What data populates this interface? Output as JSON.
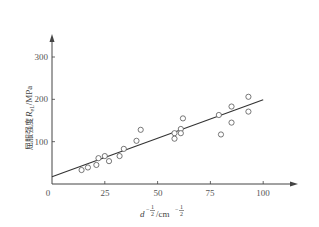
{
  "chart_data": {
    "type": "scatter",
    "title": "",
    "xlabel": "d^(-1/2)/cm^(-1/2)",
    "ylabel": "屈服强度 R_eL/MPa",
    "xlabel_parts": {
      "base": "d",
      "exp": "-1/2",
      "unit": "/cm",
      "unit_exp": "-1/2"
    },
    "ylabel_parts": {
      "text": "屈服强度",
      "symbol": "R",
      "sub": "eL",
      "unit": "/MPa"
    },
    "xlim": [
      0,
      100
    ],
    "ylim": [
      0,
      300
    ],
    "xticks": [
      0,
      25,
      50,
      75,
      100
    ],
    "yticks": [
      100,
      200,
      300
    ],
    "grid": false,
    "legend": null,
    "points": [
      {
        "x": 14,
        "y": 33
      },
      {
        "x": 17,
        "y": 39
      },
      {
        "x": 21,
        "y": 45
      },
      {
        "x": 22,
        "y": 61
      },
      {
        "x": 25,
        "y": 66
      },
      {
        "x": 27,
        "y": 54
      },
      {
        "x": 32,
        "y": 66
      },
      {
        "x": 34,
        "y": 83
      },
      {
        "x": 40,
        "y": 102
      },
      {
        "x": 42,
        "y": 128
      },
      {
        "x": 58,
        "y": 120
      },
      {
        "x": 58,
        "y": 107
      },
      {
        "x": 61,
        "y": 130
      },
      {
        "x": 61,
        "y": 120
      },
      {
        "x": 62,
        "y": 155
      },
      {
        "x": 79,
        "y": 163
      },
      {
        "x": 80,
        "y": 117
      },
      {
        "x": 85,
        "y": 183
      },
      {
        "x": 85,
        "y": 145
      },
      {
        "x": 93,
        "y": 206
      },
      {
        "x": 93,
        "y": 171
      }
    ],
    "fit_line": {
      "x": [
        0,
        100
      ],
      "y": [
        17,
        199
      ]
    }
  },
  "labels": {
    "origin": "0",
    "x_ticks": [
      "25",
      "50",
      "75",
      "100"
    ],
    "y_ticks": [
      "100",
      "200",
      "300"
    ],
    "x_title_base": "d",
    "x_title_exp_top": "1",
    "x_title_exp_bottom": "2",
    "x_title_unit": "/cm",
    "y_title_text": "屈服强度",
    "y_title_symbol": "R",
    "y_title_sub": "eL",
    "y_title_unit": "/MPa"
  },
  "colors": {
    "axis": "#444444",
    "marker": "#555555",
    "line": "#333333",
    "text": "#555555"
  }
}
